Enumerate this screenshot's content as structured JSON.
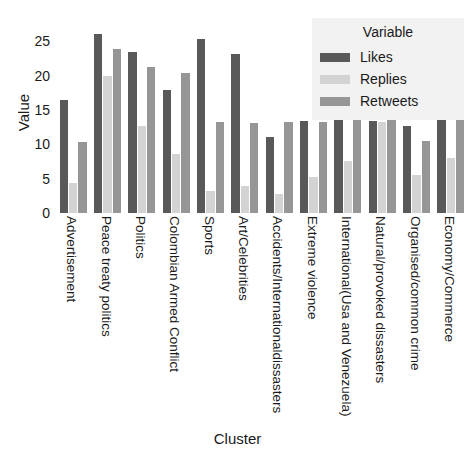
{
  "chart_data": {
    "type": "bar",
    "title": "",
    "xlabel": "Cluster",
    "ylabel": "Value",
    "ylim": [
      0,
      27.5
    ],
    "yticks": [
      0,
      5,
      10,
      15,
      20,
      25
    ],
    "grid": false,
    "legend_position": "top-right",
    "legend_title": "Variable",
    "categories": [
      "Advertisement",
      "Peace treaty politics",
      "Politics",
      "Colombian Armed Conflict",
      "Sports",
      "Art/Celebrities",
      "Accidents/Internationaldissasters",
      "Extreme violence",
      "International(Usa and Venezuela)",
      "Natural/provoked dissasters",
      "Organised/common crime",
      "Economy/Commerce"
    ],
    "series": [
      {
        "name": "Likes",
        "color": "#595959",
        "values": [
          16.4,
          26.0,
          23.5,
          17.9,
          25.3,
          23.2,
          11.1,
          13.4,
          24.8,
          13.4,
          12.6,
          14.9
        ]
      },
      {
        "name": "Replies",
        "color": "#d3d3d3",
        "values": [
          4.4,
          20.0,
          12.6,
          8.6,
          3.2,
          4.0,
          2.7,
          5.2,
          7.5,
          13.3,
          5.5,
          8.0
        ]
      },
      {
        "name": "Retweets",
        "color": "#969696",
        "values": [
          10.4,
          23.8,
          21.3,
          20.3,
          13.2,
          13.1,
          13.3,
          13.3,
          15.6,
          13.5,
          10.5,
          14.0
        ]
      }
    ]
  },
  "axes": {
    "ylabel": "Value",
    "xlabel": "Cluster",
    "ytick_labels": [
      "25",
      "20",
      "15",
      "10",
      "5",
      "0"
    ]
  },
  "legend": {
    "title": "Variable",
    "items": [
      {
        "label": "Likes",
        "color": "#595959"
      },
      {
        "label": "Replies",
        "color": "#d3d3d3"
      },
      {
        "label": "Retweets",
        "color": "#969696"
      }
    ]
  }
}
